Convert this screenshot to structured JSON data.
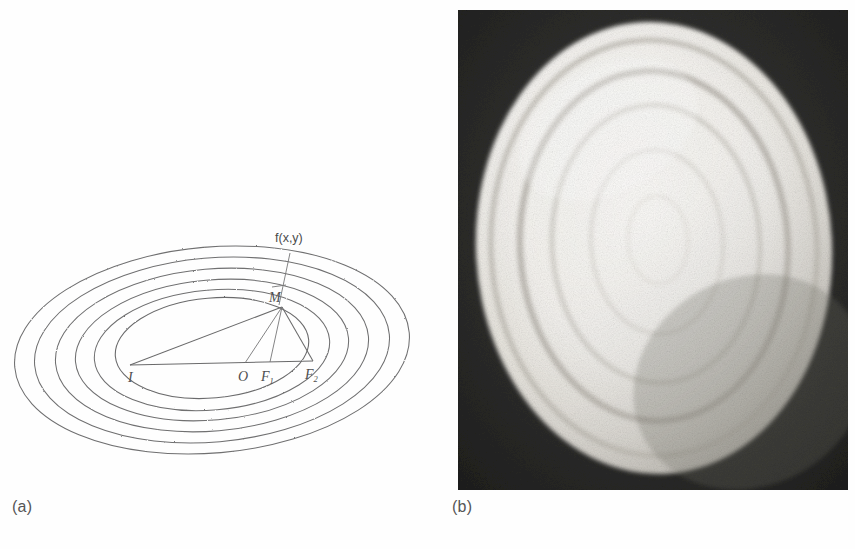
{
  "figure": {
    "panels": [
      {
        "id": "a",
        "caption": "(a)",
        "kind": "line-diagram",
        "description": "nested confocal ellipse contours with geometric construction",
        "labels": {
          "function": "f(x,y)",
          "point_m": "M",
          "point_i": "I",
          "point_o": "O",
          "focus_1_base": "F",
          "focus_1_sub": "1",
          "focus_2_base": "F",
          "focus_2_sub": "2"
        },
        "contour_count": 6
      },
      {
        "id": "b",
        "caption": "(b)",
        "kind": "photograph",
        "description": "grainy grayscale photograph of a bright oval plate with concentric ring grooves on a dark background",
        "ring_count": 4
      }
    ]
  },
  "colors": {
    "page_background": "#fefefe",
    "ink": "#6a6a6b",
    "label_text": "#4b4b4c",
    "caption_text": "#555556",
    "photo_dark": "#2a2a2a",
    "photo_light": "#f2f0ec",
    "photo_midtone": "#cfcbc4"
  }
}
